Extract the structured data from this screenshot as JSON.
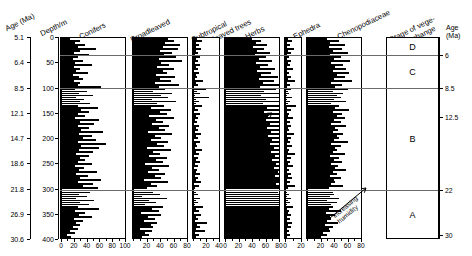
{
  "figure": {
    "axis_headers": {
      "age_label": "Age (Ma)",
      "depth_label": "Depth/m",
      "stage_label_line1": "Stage of vege-",
      "stage_label_line2": "tation change",
      "right_age_line1": "Age",
      "right_age_line2": "(Ma)"
    },
    "left_age_values": [
      "5.1",
      "6.4",
      "8.5",
      "12.1",
      "14.7",
      "18.6",
      "21.8",
      "26.9",
      "30.6"
    ],
    "left_depth_values": [
      "0",
      "50",
      "100",
      "150",
      "200",
      "250",
      "300",
      "350",
      "400"
    ],
    "right_age_ticks": [
      "6",
      "8.5",
      "12.5",
      "22",
      "30"
    ],
    "stages": [
      "D",
      "C",
      "B",
      "A"
    ],
    "annotations": [
      {
        "line1": "increasing",
        "line2": "aridity"
      },
      {
        "line1": "increasing",
        "line2": "humidity"
      }
    ]
  },
  "chart_data": {
    "type": "area",
    "ylabel": "Depth/m",
    "ylabel_secondary": "Age (Ma)",
    "xlabel": "Pollen percentage (%)",
    "grid": false,
    "legend_position": "none",
    "orientation": "horizontal-spikes-vs-depth",
    "depth_range_m": [
      0,
      400
    ],
    "age_range_ma": [
      5.1,
      30.6
    ],
    "depth_to_age_calibration": {
      "depth_m": [
        0,
        50,
        100,
        150,
        200,
        250,
        300,
        350,
        400
      ],
      "age_ma": [
        5.1,
        6.4,
        8.5,
        12.1,
        14.7,
        18.6,
        21.8,
        26.9,
        30.6
      ]
    },
    "zone_boundaries_ma": [
      6,
      8.5,
      22
    ],
    "vegetation_stages": [
      {
        "name": "D",
        "age_top_ma": 5.1,
        "age_base_ma": 6
      },
      {
        "name": "C",
        "age_top_ma": 6,
        "age_base_ma": 8.5
      },
      {
        "name": "B",
        "age_top_ma": 8.5,
        "age_base_ma": 22
      },
      {
        "name": "A",
        "age_top_ma": 22,
        "age_base_ma": 30.6
      }
    ],
    "series": [
      {
        "name": "Conifers",
        "xlim": [
          0,
          100
        ],
        "ticks": [
          0,
          20,
          40,
          60,
          80,
          100
        ],
        "values": [
          14,
          30,
          22,
          38,
          26,
          55,
          30,
          20,
          44,
          26,
          18,
          34,
          22,
          48,
          20,
          30,
          24,
          42,
          18,
          28,
          34,
          20,
          30,
          26,
          62,
          22,
          40,
          28,
          50,
          24,
          36,
          30,
          46,
          26,
          58,
          32,
          44,
          26,
          38,
          22,
          60,
          30,
          52,
          26,
          44,
          32,
          66,
          28,
          48,
          34,
          54,
          26,
          70,
          32,
          60,
          28,
          50,
          24,
          44,
          30,
          38,
          26,
          48,
          22,
          36,
          28,
          56,
          24,
          42,
          30,
          62,
          26,
          50,
          34,
          58,
          22,
          46,
          28,
          40,
          24,
          52,
          30,
          44,
          26,
          60,
          22,
          38,
          28,
          48,
          20,
          34,
          24,
          30,
          18,
          26,
          14,
          22,
          10,
          16,
          8
        ]
      },
      {
        "name": "Broadleaved trees",
        "xlim": [
          0,
          80
        ],
        "ticks": [
          20,
          40,
          60,
          80
        ],
        "values": [
          52,
          60,
          48,
          70,
          44,
          66,
          40,
          58,
          46,
          64,
          38,
          72,
          42,
          54,
          36,
          60,
          44,
          50,
          34,
          62,
          40,
          56,
          32,
          68,
          38,
          48,
          30,
          58,
          42,
          52,
          28,
          64,
          36,
          46,
          26,
          56,
          40,
          50,
          24,
          60,
          34,
          44,
          28,
          54,
          38,
          48,
          22,
          58,
          32,
          42,
          26,
          52,
          36,
          46,
          20,
          56,
          30,
          40,
          24,
          50,
          34,
          44,
          18,
          54,
          28,
          38,
          22,
          48,
          32,
          42,
          16,
          52,
          26,
          36,
          20,
          46,
          30,
          40,
          14,
          50,
          24,
          34,
          18,
          44,
          28,
          38,
          12,
          42,
          22,
          32,
          16,
          36,
          26,
          30,
          10,
          28,
          18,
          24,
          14,
          20
        ]
      },
      {
        "name": "Subtropical broadleaved trees",
        "xlim": [
          0,
          40
        ],
        "ticks": [
          20,
          40
        ],
        "values": [
          6,
          14,
          5,
          9,
          4,
          12,
          5,
          7,
          3,
          10,
          4,
          8,
          3,
          11,
          5,
          7,
          2,
          9,
          4,
          6,
          3,
          16,
          5,
          8,
          2,
          20,
          6,
          10,
          3,
          24,
          5,
          9,
          4,
          14,
          3,
          7,
          2,
          11,
          5,
          8,
          3,
          6,
          2,
          9,
          4,
          7,
          3,
          12,
          5,
          8,
          2,
          10,
          4,
          6,
          3,
          14,
          5,
          9,
          2,
          7,
          4,
          11,
          3,
          8,
          2,
          6,
          5,
          10,
          3,
          7,
          4,
          13,
          2,
          9,
          3,
          6,
          5,
          8,
          2,
          11,
          4,
          7,
          3,
          16,
          5,
          9,
          2,
          12,
          4,
          8,
          3,
          22,
          6,
          10,
          4,
          18,
          3,
          9,
          5,
          7
        ]
      },
      {
        "name": "Herbs",
        "xlim": [
          0,
          80
        ],
        "ticks": [
          20,
          40,
          60,
          80
        ],
        "values": [
          40,
          54,
          46,
          62,
          42,
          58,
          48,
          66,
          44,
          60,
          50,
          70,
          46,
          64,
          52,
          74,
          48,
          68,
          54,
          78,
          50,
          72,
          56,
          82,
          52,
          76,
          58,
          86,
          54,
          80,
          60,
          90,
          56,
          84,
          62,
          88,
          58,
          82,
          64,
          92,
          60,
          86,
          66,
          90,
          62,
          84,
          68,
          94,
          64,
          88,
          70,
          92,
          66,
          86,
          72,
          96,
          68,
          90,
          74,
          94,
          70,
          88,
          76,
          92,
          72,
          86,
          78,
          96,
          74,
          90,
          80,
          94,
          76,
          88,
          82,
          92,
          78,
          86,
          84,
          96,
          80,
          90,
          86,
          94,
          82,
          88,
          90,
          96,
          84,
          92,
          88,
          98,
          86,
          94,
          90,
          96,
          88,
          92,
          94,
          98
        ]
      },
      {
        "name": "Ephedra",
        "xlim": [
          0,
          20
        ],
        "ticks": [
          20
        ],
        "values": [
          4,
          9,
          3,
          6,
          2,
          11,
          4,
          7,
          3,
          5,
          2,
          8,
          4,
          6,
          2,
          10,
          3,
          5,
          2,
          7,
          4,
          12,
          3,
          6,
          2,
          8,
          4,
          5,
          3,
          9,
          2,
          6,
          4,
          14,
          3,
          7,
          2,
          5,
          4,
          10,
          3,
          6,
          2,
          8,
          4,
          5,
          3,
          11,
          2,
          7,
          4,
          6,
          3,
          9,
          2,
          5,
          4,
          13,
          3,
          8,
          2,
          6,
          4,
          10,
          3,
          5,
          2,
          7,
          4,
          9,
          3,
          6,
          2,
          12,
          4,
          7,
          3,
          5,
          2,
          8,
          4,
          6,
          3,
          10,
          2,
          5,
          4,
          8,
          3,
          6,
          2,
          9,
          4,
          7,
          3,
          5,
          2,
          6,
          3,
          4
        ]
      },
      {
        "name": "Chenopodiaceae",
        "xlim": [
          0,
          80
        ],
        "ticks": [
          20,
          40,
          60,
          80
        ],
        "values": [
          30,
          48,
          34,
          56,
          32,
          52,
          38,
          60,
          34,
          50,
          40,
          64,
          36,
          54,
          42,
          58,
          38,
          62,
          44,
          56,
          40,
          66,
          36,
          52,
          42,
          60,
          38,
          54,
          44,
          50,
          40,
          58,
          36,
          48,
          42,
          62,
          38,
          52,
          44,
          56,
          40,
          50,
          36,
          58,
          42,
          46,
          38,
          54,
          44,
          48,
          40,
          60,
          36,
          50,
          42,
          44,
          38,
          56,
          34,
          48,
          40,
          52,
          36,
          46,
          42,
          58,
          38,
          44,
          34,
          50,
          40,
          42,
          36,
          54,
          32,
          46,
          38,
          40,
          34,
          48,
          30,
          44,
          36,
          38,
          32,
          50,
          28,
          42,
          34,
          36,
          30,
          46,
          26,
          38,
          32,
          34,
          24,
          30,
          20,
          26
        ]
      }
    ]
  }
}
